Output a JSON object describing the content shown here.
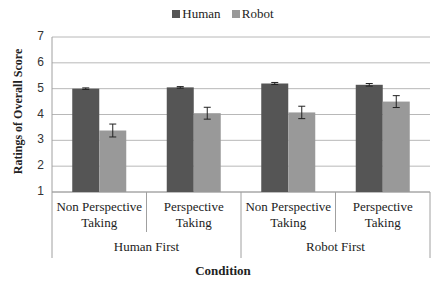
{
  "chart_data": {
    "type": "bar",
    "title": "",
    "xlabel": "Condition",
    "ylabel": "Ratings of Overall Score",
    "ylim": [
      1,
      7
    ],
    "yticks": [
      1,
      2,
      3,
      4,
      5,
      6,
      7
    ],
    "grid": true,
    "legend_position": "top",
    "groups": [
      {
        "label": "Human First",
        "categories": [
          "Non Perspective Taking",
          "Perspective Taking"
        ]
      },
      {
        "label": "Robot First",
        "categories": [
          "Non Perspective Taking",
          "Perspective Taking"
        ]
      }
    ],
    "categories": [
      "Human First / Non Perspective Taking",
      "Human First / Perspective Taking",
      "Robot First / Non Perspective Taking",
      "Robot First / Perspective Taking"
    ],
    "category_lines": [
      [
        "Non Perspective",
        "Taking"
      ],
      [
        "Perspective",
        "Taking"
      ],
      [
        "Non Perspective",
        "Taking"
      ],
      [
        "Perspective",
        "Taking"
      ]
    ],
    "series": [
      {
        "name": "Human",
        "color": "#555555",
        "values": [
          5.0,
          5.05,
          5.2,
          5.15
        ],
        "errors": [
          0.03,
          0.03,
          0.04,
          0.05
        ]
      },
      {
        "name": "Robot",
        "color": "#999999",
        "values": [
          3.38,
          4.05,
          4.08,
          4.5
        ],
        "errors": [
          0.25,
          0.23,
          0.24,
          0.23
        ]
      }
    ]
  },
  "legend": {
    "items": [
      {
        "label": "Human",
        "color": "#555555"
      },
      {
        "label": "Robot",
        "color": "#999999"
      }
    ]
  }
}
